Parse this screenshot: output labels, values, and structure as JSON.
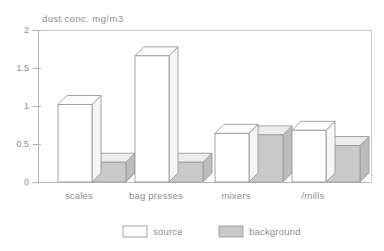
{
  "chart_data": {
    "type": "bar",
    "title": "dust conc. mg/m3",
    "xlabel": "",
    "ylabel": "dust conc. mg/m3",
    "ylim": [
      0,
      2
    ],
    "yticks": [
      0,
      0.5,
      1,
      1.5,
      2
    ],
    "ytick_labels": [
      "0",
      "0.5",
      "1",
      "1.5",
      "2"
    ],
    "grid": false,
    "legend_position": "bottom",
    "categories": [
      "scales",
      "bag presses",
      "mixers",
      "/mills"
    ],
    "series": [
      {
        "name": "source",
        "values": [
          1.02,
          1.66,
          0.64,
          0.68
        ],
        "color": "#ffffff"
      },
      {
        "name": "background",
        "values": [
          0.26,
          0.26,
          0.62,
          0.48
        ],
        "color": "#c9c9c9"
      }
    ]
  },
  "axis": {
    "title": "dust conc. mg/m3",
    "tick_0": "0",
    "tick_1": "0.5",
    "tick_2": "1",
    "tick_3": "1.5",
    "tick_4": "2"
  },
  "categories": {
    "c0": "scales",
    "c1": "bag presses",
    "c2": "mixers",
    "c3": "/mills"
  },
  "legend": {
    "source_label": "source",
    "background_label": "background"
  }
}
